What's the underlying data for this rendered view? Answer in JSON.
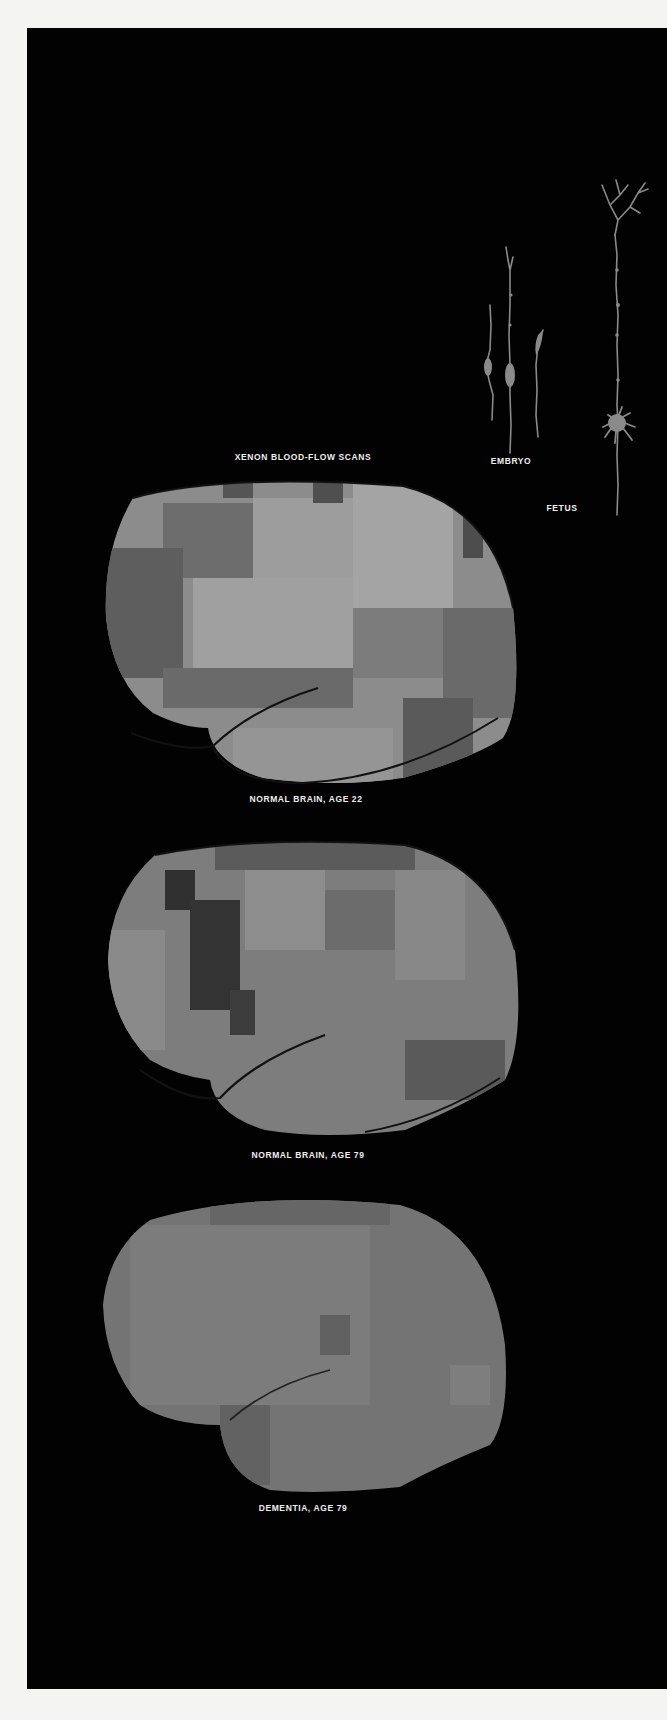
{
  "figure": {
    "title": "XENON BLOOD-FLOW SCANS",
    "scans": [
      {
        "caption": "NORMAL BRAIN, AGE 22",
        "contrast": "high"
      },
      {
        "caption": "NORMAL BRAIN, AGE 79",
        "contrast": "medium"
      },
      {
        "caption": "DEMENTIA, AGE 79",
        "contrast": "low"
      }
    ],
    "neurons": [
      {
        "label": "EMBRYO"
      },
      {
        "label": "FETUS"
      }
    ],
    "colors": {
      "background": "#020202",
      "page": "#f4f4f2",
      "text": "#efefef",
      "neuron": "#8a8a8a"
    }
  }
}
